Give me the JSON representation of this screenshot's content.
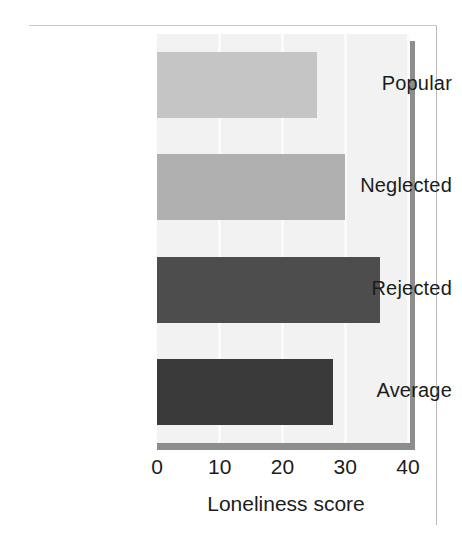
{
  "chart_data": {
    "type": "bar",
    "orientation": "horizontal",
    "title": "",
    "xlabel": "Loneliness score",
    "ylabel": "",
    "categories": [
      "Popular",
      "Neglected",
      "Rejected",
      "Average"
    ],
    "values": [
      25.5,
      30,
      35.5,
      28
    ],
    "bar_colors": [
      "#c5c5c5",
      "#b0b0b0",
      "#4d4d4d",
      "#3a3a3a"
    ],
    "xlim": [
      0,
      40
    ],
    "xticks": [
      0,
      10,
      20,
      30,
      40
    ],
    "xtick_labels": [
      "0",
      "10",
      "20",
      "30",
      "40"
    ],
    "grid": true,
    "grid_axis": "x",
    "grid_color": "#fbfbfb",
    "legend": false,
    "plot_background": "#f2f2f2",
    "shadow_color": "#8d8d8d"
  }
}
